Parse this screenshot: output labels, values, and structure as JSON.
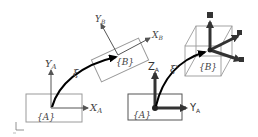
{
  "left_panel": {
    "frame_a_label": "{A}",
    "x_axis_label": "X",
    "x_axis_sub": "A",
    "y_axis_label": "Y",
    "y_axis_sub": "A",
    "transform_label": "ξ",
    "frame_b_label": "{B}",
    "xb_axis_label": "X",
    "xb_axis_sub": "B",
    "yb_axis_label": "Y",
    "yb_axis_sub": "B"
  },
  "right_panel": {
    "frame_a_label": "{A}",
    "z_axis_label": "Z",
    "z_axis_sub": "A",
    "y_axis_label": "Y",
    "y_axis_sub": "A",
    "transform_label": "ξ'",
    "frame_b_label": "{B}"
  },
  "colors": {
    "box_stroke": "#9a9a9a",
    "axis_thin": "#555555",
    "axis_thick": "#333333",
    "arrow": "#000000"
  }
}
